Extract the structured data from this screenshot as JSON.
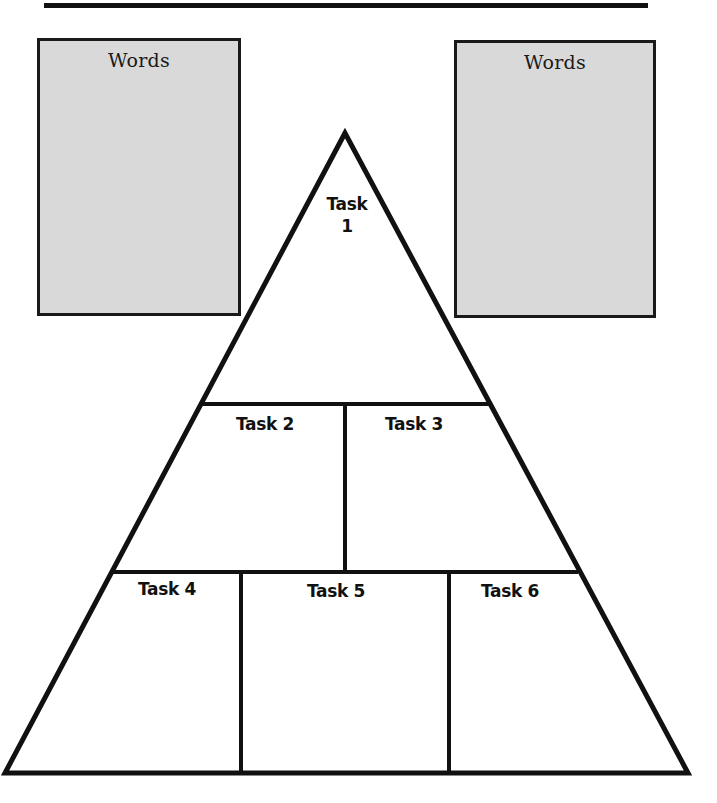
{
  "word_boxes": [
    {
      "title": "Words"
    },
    {
      "title": "Words"
    }
  ],
  "pyramid": {
    "tasks": [
      {
        "label": "Task",
        "number": "1"
      },
      {
        "label": "Task 2"
      },
      {
        "label": "Task 3"
      },
      {
        "label": "Task 4"
      },
      {
        "label": "Task 5"
      },
      {
        "label": "Task 6"
      }
    ]
  },
  "colors": {
    "box_fill": "#d9d9d9",
    "line": "#111111",
    "background": "#ffffff"
  }
}
